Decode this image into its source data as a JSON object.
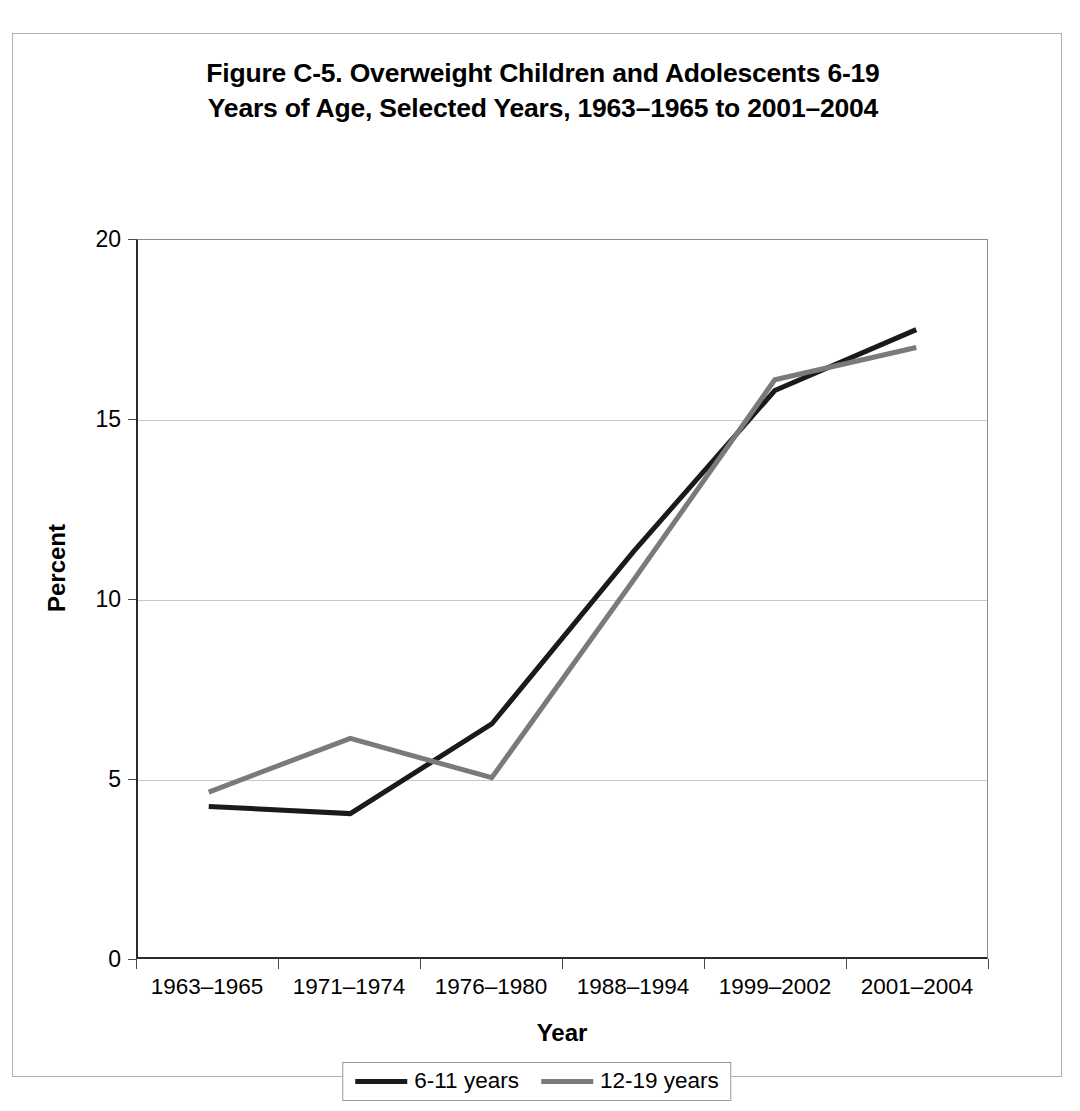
{
  "figure": {
    "title_line1": "Figure C-5. Overweight Children and Adolescents 6-19",
    "title_line2": "Years of Age, Selected Years, 1963–1965 to 2001–2004"
  },
  "colors": {
    "series_6_11": "#1a1a1a",
    "series_12_19": "#7a7a7a",
    "gridline": "#c9c9c9",
    "axis": "#2b2b2b",
    "frame": "#b0b0b0",
    "text": "#000000"
  },
  "chart_data": {
    "type": "line",
    "title": "Figure C-5. Overweight Children and Adolescents 6-19 Years of Age, Selected Years, 1963–1965 to 2001–2004",
    "xlabel": "Year",
    "ylabel": "Percent",
    "categories": [
      "1963–1965",
      "1971–1974",
      "1976–1980",
      "1988–1994",
      "1999–2002",
      "2001–2004"
    ],
    "series": [
      {
        "name": "6-11 years",
        "color": "#1a1a1a",
        "values": [
          4.2,
          4.0,
          6.5,
          11.3,
          15.8,
          17.5
        ]
      },
      {
        "name": "12-19 years",
        "color": "#7a7a7a",
        "values": [
          4.6,
          6.1,
          5.0,
          10.5,
          16.1,
          17.0
        ]
      }
    ],
    "ylim": [
      0,
      20
    ],
    "yticks": [
      0,
      5,
      10,
      15,
      20
    ],
    "ytick_labels": [
      "0",
      "5",
      "10",
      "15",
      "20"
    ],
    "grid": true,
    "grid_axis": "y",
    "legend_position": "bottom"
  }
}
